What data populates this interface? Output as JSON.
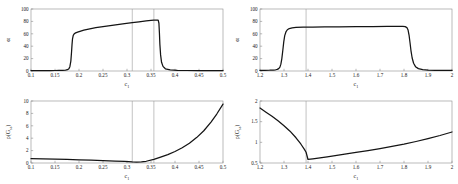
{
  "figure": {
    "background": "#ffffff",
    "curve_color": "#141414",
    "axis_color": "#8c8c8c",
    "marker_color": "#9a9a9a"
  },
  "chart_data": [
    {
      "type": "line",
      "panel": "top-left",
      "title": "",
      "xlabel": "c",
      "xlabel_sub": "1",
      "ylabel": "α",
      "ylabel_sub": "",
      "xlim": [
        0.1,
        0.5
      ],
      "ylim": [
        0,
        100
      ],
      "xticks": [
        0.1,
        0.15,
        0.2,
        0.25,
        0.3,
        0.35,
        0.4,
        0.45,
        0.5
      ],
      "xticklabels": [
        "0.1",
        "0.15",
        "0.2",
        "0.25",
        "0.3",
        "0.35",
        "0.4",
        "0.45",
        "0.5"
      ],
      "yticks": [
        0,
        20,
        40,
        60,
        80,
        100
      ],
      "yticklabels": [
        "0",
        "20",
        "40",
        "60",
        "80",
        "100"
      ],
      "grid": false,
      "legend": "none",
      "vlines": [
        0.311,
        0.356
      ],
      "x": [
        0.1,
        0.11,
        0.12,
        0.13,
        0.14,
        0.15,
        0.158,
        0.166,
        0.172,
        0.176,
        0.179,
        0.181,
        0.183,
        0.1845,
        0.1855,
        0.1865,
        0.188,
        0.19,
        0.193,
        0.197,
        0.202,
        0.21,
        0.22,
        0.235,
        0.25,
        0.265,
        0.28,
        0.295,
        0.311,
        0.325,
        0.34,
        0.35,
        0.356,
        0.362,
        0.365,
        0.3665,
        0.3675,
        0.3685,
        0.37,
        0.372,
        0.375,
        0.38,
        0.39,
        0.405,
        0.425,
        0.45,
        0.475,
        0.5
      ],
      "y": [
        0.5,
        0.5,
        0.6,
        0.6,
        0.7,
        0.8,
        0.9,
        1.1,
        1.5,
        2.2,
        3.8,
        7.0,
        16.0,
        31.0,
        43.0,
        52.0,
        57.5,
        60.0,
        61.5,
        62.8,
        64.0,
        65.8,
        67.6,
        69.8,
        71.6,
        73.2,
        74.8,
        76.4,
        78.0,
        79.4,
        80.8,
        81.6,
        82.0,
        82.2,
        82.2,
        77.0,
        62.0,
        43.0,
        26.0,
        14.0,
        7.5,
        3.6,
        1.8,
        1.1,
        0.8,
        0.6,
        0.5,
        0.5
      ]
    },
    {
      "type": "line",
      "panel": "top-right",
      "title": "",
      "xlabel": "c",
      "xlabel_sub": "1",
      "ylabel": "α",
      "ylabel_sub": "",
      "xlim": [
        1.2,
        2.0
      ],
      "ylim": [
        0,
        100
      ],
      "xticks": [
        1.2,
        1.3,
        1.4,
        1.5,
        1.6,
        1.7,
        1.8,
        1.9,
        2.0
      ],
      "xticklabels": [
        "1.2",
        "1.3",
        "1.4",
        "1.5",
        "1.6",
        "1.7",
        "1.8",
        "1.9",
        "2"
      ],
      "yticks": [
        0,
        20,
        40,
        60,
        80,
        100
      ],
      "yticklabels": [
        "0",
        "20",
        "40",
        "60",
        "80",
        "100"
      ],
      "grid": false,
      "legend": "none",
      "vlines": [
        1.392
      ],
      "x": [
        1.2,
        1.22,
        1.24,
        1.255,
        1.265,
        1.272,
        1.278,
        1.283,
        1.287,
        1.291,
        1.295,
        1.299,
        1.303,
        1.308,
        1.314,
        1.322,
        1.334,
        1.35,
        1.38,
        1.42,
        1.47,
        1.53,
        1.6,
        1.67,
        1.73,
        1.775,
        1.795,
        1.805,
        1.812,
        1.817,
        1.821,
        1.825,
        1.829,
        1.834,
        1.84,
        1.848,
        1.86,
        1.878,
        1.9,
        1.93,
        1.96,
        2.0
      ],
      "y": [
        1.0,
        1.1,
        1.3,
        1.6,
        2.0,
        2.6,
        3.8,
        6.2,
        11.0,
        20.0,
        33.0,
        47.0,
        57.0,
        63.0,
        66.5,
        68.5,
        69.6,
        70.2,
        70.6,
        70.8,
        71.0,
        71.2,
        71.4,
        71.6,
        71.8,
        72.0,
        72.0,
        71.5,
        70.0,
        66.0,
        58.0,
        46.0,
        33.0,
        21.0,
        12.5,
        7.0,
        3.8,
        2.1,
        1.4,
        1.1,
        1.0,
        1.0
      ]
    },
    {
      "type": "line",
      "panel": "bottom-left",
      "title": "",
      "xlabel": "c",
      "xlabel_sub": "1",
      "ylabel": "ρ(G",
      "ylabel_sub": "ss",
      "ylabel_tail": ")",
      "xlim": [
        0.1,
        0.5
      ],
      "ylim": [
        0,
        10
      ],
      "xticks": [
        0.1,
        0.15,
        0.2,
        0.25,
        0.3,
        0.35,
        0.4,
        0.45,
        0.5
      ],
      "xticklabels": [
        "0.1",
        "0.15",
        "0.2",
        "0.25",
        "0.3",
        "0.35",
        "0.4",
        "0.45",
        "0.5"
      ],
      "yticks": [
        0,
        2,
        4,
        6,
        8,
        10
      ],
      "yticklabels": [
        "0",
        "2",
        "4",
        "6",
        "8",
        "10"
      ],
      "grid": false,
      "legend": "none",
      "vlines": [
        0.311,
        0.356
      ],
      "x": [
        0.1,
        0.125,
        0.15,
        0.175,
        0.2,
        0.225,
        0.25,
        0.275,
        0.295,
        0.311,
        0.32,
        0.33,
        0.34,
        0.356,
        0.37,
        0.385,
        0.4,
        0.415,
        0.43,
        0.445,
        0.46,
        0.475,
        0.487,
        0.5
      ],
      "y": [
        0.7,
        0.66,
        0.62,
        0.57,
        0.52,
        0.46,
        0.4,
        0.32,
        0.25,
        0.18,
        0.16,
        0.18,
        0.28,
        0.58,
        0.95,
        1.35,
        1.85,
        2.45,
        3.2,
        4.1,
        5.2,
        6.6,
        7.9,
        9.5
      ]
    },
    {
      "type": "line",
      "panel": "bottom-right",
      "title": "",
      "xlabel": "c",
      "xlabel_sub": "1",
      "ylabel": "ρ(G",
      "ylabel_sub": "ss",
      "ylabel_tail": ")",
      "xlim": [
        1.2,
        2.0
      ],
      "ylim": [
        0.5,
        2.0
      ],
      "xticks": [
        1.2,
        1.3,
        1.4,
        1.5,
        1.6,
        1.7,
        1.8,
        1.9,
        2.0
      ],
      "xticklabels": [
        "1.2",
        "1.3",
        "1.4",
        "1.5",
        "1.6",
        "1.7",
        "1.8",
        "1.9",
        "2"
      ],
      "yticks": [
        0.5,
        1.0,
        1.5,
        2.0
      ],
      "yticklabels": [
        "0.5",
        "1",
        "1.5",
        "2"
      ],
      "grid": false,
      "legend": "none",
      "vlines": [
        1.392
      ],
      "x": [
        1.2,
        1.225,
        1.25,
        1.275,
        1.3,
        1.325,
        1.35,
        1.37,
        1.385,
        1.392,
        1.4,
        1.42,
        1.45,
        1.48,
        1.52,
        1.56,
        1.6,
        1.65,
        1.7,
        1.75,
        1.8,
        1.85,
        1.9,
        1.95,
        2.0
      ],
      "y": [
        1.83,
        1.73,
        1.63,
        1.52,
        1.4,
        1.27,
        1.11,
        0.96,
        0.83,
        0.76,
        0.585,
        0.6,
        0.625,
        0.65,
        0.685,
        0.72,
        0.755,
        0.8,
        0.85,
        0.9,
        0.955,
        1.02,
        1.09,
        1.165,
        1.25
      ]
    }
  ]
}
